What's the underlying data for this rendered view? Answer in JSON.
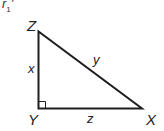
{
  "figure": {
    "label": "r",
    "label_subscript": "1",
    "label_suffix": "'",
    "colors": {
      "line": "#1e1e1e",
      "text": "#222222",
      "background": "#ffffff"
    },
    "triangle": {
      "type": "right-triangle",
      "right_angle_at": "Y",
      "vertices": [
        {
          "name": "Z",
          "label": "Z",
          "x": 38,
          "y": 31
        },
        {
          "name": "Y",
          "label": "Y",
          "x": 38,
          "y": 108
        },
        {
          "name": "X",
          "label": "X",
          "x": 142,
          "y": 108
        }
      ],
      "sides": [
        {
          "name": "ZY",
          "label": "x"
        },
        {
          "name": "ZX",
          "label": "y"
        },
        {
          "name": "YX",
          "label": "z"
        }
      ]
    }
  }
}
